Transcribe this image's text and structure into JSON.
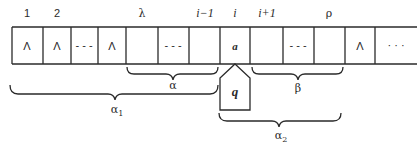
{
  "diagram": {
    "type": "turing-machine-configuration",
    "index_labels": [
      {
        "text": "1",
        "x": 27
      },
      {
        "text": "2",
        "x": 57
      },
      {
        "text": "λ",
        "x": 142
      },
      {
        "text": "i−1",
        "x": 205
      },
      {
        "text": "i",
        "x": 235
      },
      {
        "text": "i+1",
        "x": 267
      },
      {
        "text": "ρ",
        "x": 329
      }
    ],
    "cells": [
      {
        "content": "Λ"
      },
      {
        "content": "Λ"
      },
      {
        "content": "- - -"
      },
      {
        "content": "Λ"
      },
      {
        "content": ""
      },
      {
        "content": "- - -"
      },
      {
        "content": ""
      },
      {
        "content": "a"
      },
      {
        "content": ""
      },
      {
        "content": "- - -"
      },
      {
        "content": ""
      },
      {
        "content": "Λ"
      },
      {
        "content": "· · ·"
      }
    ],
    "head": {
      "state": "q",
      "position_label": "i"
    },
    "braces": {
      "alpha": "α",
      "beta": "β",
      "alpha1": "α",
      "alpha1_sub": "1",
      "alpha2": "α",
      "alpha2_sub": "2"
    },
    "colors": {
      "stroke": "#2a2a2a",
      "background": "#ffffff"
    }
  }
}
